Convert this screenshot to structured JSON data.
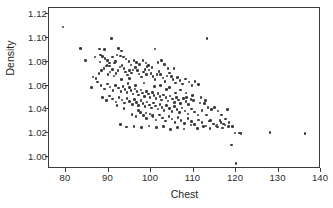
{
  "chart_data": {
    "type": "scatter",
    "title": "",
    "xlabel": "Chest",
    "ylabel": "Density",
    "xlim": [
      76,
      140
    ],
    "ylim": [
      0.99,
      1.125
    ],
    "xticks": [
      80,
      90,
      100,
      110,
      120,
      130,
      140
    ],
    "xtick_labels": [
      "80",
      "90",
      "100",
      "110",
      "120",
      "130",
      "140"
    ],
    "yticks": [
      1.0,
      1.02,
      1.04,
      1.06,
      1.08,
      1.1,
      1.12
    ],
    "ytick_labels": [
      "1.00",
      "1.02",
      "1.04",
      "1.06",
      "1.08",
      "1.10",
      "1.12"
    ],
    "grid": false,
    "legend": null,
    "marker_color": "#3b3b3b",
    "marker_size": 2.6,
    "n_points": 251,
    "correlation": "negative",
    "points": [
      [
        79.3,
        1.1089
      ],
      [
        83.4,
        1.0908
      ],
      [
        87.9,
        1.0905
      ],
      [
        89.0,
        1.0902
      ],
      [
        90.7,
        1.0993
      ],
      [
        92.4,
        1.0911
      ],
      [
        93.1,
        1.0889
      ],
      [
        84.6,
        1.0812
      ],
      [
        88.1,
        1.0855
      ],
      [
        88.6,
        1.0843
      ],
      [
        89.2,
        1.0828
      ],
      [
        89.8,
        1.0808
      ],
      [
        90.3,
        1.079
      ],
      [
        91.0,
        1.0838
      ],
      [
        91.6,
        1.0803
      ],
      [
        92.0,
        1.0857
      ],
      [
        92.8,
        1.0848
      ],
      [
        93.5,
        1.084
      ],
      [
        94.1,
        1.0822
      ],
      [
        94.8,
        1.0799
      ],
      [
        95.3,
        1.0771
      ],
      [
        96.0,
        1.0812
      ],
      [
        96.6,
        1.0793
      ],
      [
        97.3,
        1.0775
      ],
      [
        98.1,
        1.081
      ],
      [
        98.8,
        1.0788
      ],
      [
        99.4,
        1.0768
      ],
      [
        100.2,
        1.0752
      ],
      [
        100.9,
        1.0905
      ],
      [
        101.6,
        1.0795
      ],
      [
        102.5,
        1.081
      ],
      [
        103.2,
        1.0774
      ],
      [
        104.0,
        1.0744
      ],
      [
        105.4,
        1.0741
      ],
      [
        86.4,
        1.0671
      ],
      [
        87.1,
        1.0658
      ],
      [
        87.8,
        1.0699
      ],
      [
        88.4,
        1.0724
      ],
      [
        88.9,
        1.0745
      ],
      [
        89.4,
        1.0763
      ],
      [
        89.9,
        1.069
      ],
      [
        90.4,
        1.0712
      ],
      [
        90.9,
        1.0735
      ],
      [
        91.3,
        1.068
      ],
      [
        91.8,
        1.0702
      ],
      [
        92.2,
        1.0728
      ],
      [
        92.7,
        1.0755
      ],
      [
        93.2,
        1.077
      ],
      [
        93.6,
        1.0742
      ],
      [
        94.0,
        1.0715
      ],
      [
        94.5,
        1.0688
      ],
      [
        94.9,
        1.066
      ],
      [
        95.4,
        1.0706
      ],
      [
        95.8,
        1.0731
      ],
      [
        96.3,
        1.0752
      ],
      [
        96.8,
        1.0725
      ],
      [
        97.2,
        1.0698
      ],
      [
        97.7,
        1.067
      ],
      [
        98.2,
        1.0712
      ],
      [
        98.6,
        1.0736
      ],
      [
        99.1,
        1.076
      ],
      [
        99.5,
        1.073
      ],
      [
        100.0,
        1.0703
      ],
      [
        100.5,
        1.0676
      ],
      [
        100.9,
        1.0648
      ],
      [
        101.4,
        1.0694
      ],
      [
        101.9,
        1.0718
      ],
      [
        102.3,
        1.069
      ],
      [
        102.8,
        1.0662
      ],
      [
        103.3,
        1.0635
      ],
      [
        103.8,
        1.068
      ],
      [
        104.3,
        1.0704
      ],
      [
        104.8,
        1.0676
      ],
      [
        105.2,
        1.0648
      ],
      [
        105.7,
        1.062
      ],
      [
        106.2,
        1.0666
      ],
      [
        106.8,
        1.064
      ],
      [
        107.4,
        1.0612
      ],
      [
        108.1,
        1.0655
      ],
      [
        108.9,
        1.0628
      ],
      [
        109.6,
        1.06
      ],
      [
        110.4,
        1.0634
      ],
      [
        111.2,
        1.0608
      ],
      [
        86.0,
        1.0581
      ],
      [
        87.4,
        1.0628
      ],
      [
        88.2,
        1.06
      ],
      [
        89.0,
        1.0572
      ],
      [
        89.7,
        1.0612
      ],
      [
        90.4,
        1.0588
      ],
      [
        91.1,
        1.056
      ],
      [
        91.7,
        1.0602
      ],
      [
        92.3,
        1.0578
      ],
      [
        92.9,
        1.055
      ],
      [
        93.4,
        1.0592
      ],
      [
        93.9,
        1.0568
      ],
      [
        94.4,
        1.054
      ],
      [
        94.9,
        1.0582
      ],
      [
        95.3,
        1.0558
      ],
      [
        95.8,
        1.053
      ],
      [
        96.2,
        1.0572
      ],
      [
        96.7,
        1.0548
      ],
      [
        97.1,
        1.052
      ],
      [
        97.6,
        1.0562
      ],
      [
        98.0,
        1.0538
      ],
      [
        98.5,
        1.051
      ],
      [
        98.9,
        1.0552
      ],
      [
        99.4,
        1.0528
      ],
      [
        99.8,
        1.05
      ],
      [
        100.3,
        1.0542
      ],
      [
        100.7,
        1.0518
      ],
      [
        101.2,
        1.049
      ],
      [
        101.6,
        1.0532
      ],
      [
        102.1,
        1.0508
      ],
      [
        102.5,
        1.048
      ],
      [
        103.0,
        1.0522
      ],
      [
        103.5,
        1.0498
      ],
      [
        104.0,
        1.047
      ],
      [
        104.5,
        1.0512
      ],
      [
        105.0,
        1.0488
      ],
      [
        105.5,
        1.046
      ],
      [
        106.0,
        1.0502
      ],
      [
        106.5,
        1.0478
      ],
      [
        107.0,
        1.045
      ],
      [
        107.6,
        1.0492
      ],
      [
        108.2,
        1.0468
      ],
      [
        108.8,
        1.044
      ],
      [
        109.4,
        1.0482
      ],
      [
        88.6,
        1.0498
      ],
      [
        89.5,
        1.0472
      ],
      [
        90.3,
        1.0512
      ],
      [
        91.0,
        1.0488
      ],
      [
        91.8,
        1.0462
      ],
      [
        92.5,
        1.0502
      ],
      [
        93.2,
        1.0478
      ],
      [
        93.8,
        1.0452
      ],
      [
        94.4,
        1.0492
      ],
      [
        95.0,
        1.0468
      ],
      [
        95.6,
        1.0442
      ],
      [
        96.1,
        1.0482
      ],
      [
        96.6,
        1.0458
      ],
      [
        97.1,
        1.0432
      ],
      [
        97.6,
        1.0472
      ],
      [
        98.1,
        1.0448
      ],
      [
        98.6,
        1.0422
      ],
      [
        99.1,
        1.0462
      ],
      [
        99.6,
        1.0438
      ],
      [
        100.1,
        1.0412
      ],
      [
        100.6,
        1.0452
      ],
      [
        101.1,
        1.0428
      ],
      [
        101.6,
        1.0402
      ],
      [
        102.1,
        1.0442
      ],
      [
        102.6,
        1.0418
      ],
      [
        103.1,
        1.0392
      ],
      [
        103.7,
        1.0432
      ],
      [
        104.3,
        1.0408
      ],
      [
        104.9,
        1.0382
      ],
      [
        105.5,
        1.0422
      ],
      [
        106.1,
        1.0398
      ],
      [
        106.7,
        1.0372
      ],
      [
        107.3,
        1.0412
      ],
      [
        108.0,
        1.0388
      ],
      [
        108.7,
        1.0362
      ],
      [
        109.5,
        1.0402
      ],
      [
        110.3,
        1.0378
      ],
      [
        111.1,
        1.0352
      ],
      [
        112.0,
        1.0392
      ],
      [
        95.5,
        1.0358
      ],
      [
        96.5,
        1.0338
      ],
      [
        97.5,
        1.0372
      ],
      [
        98.3,
        1.0348
      ],
      [
        99.0,
        1.0322
      ],
      [
        99.8,
        1.0362
      ],
      [
        100.5,
        1.0338
      ],
      [
        101.2,
        1.0312
      ],
      [
        102.0,
        1.0352
      ],
      [
        102.7,
        1.0328
      ],
      [
        103.4,
        1.0302
      ],
      [
        104.2,
        1.0342
      ],
      [
        104.9,
        1.0318
      ],
      [
        105.6,
        1.0292
      ],
      [
        106.4,
        1.0332
      ],
      [
        107.1,
        1.0308
      ],
      [
        107.9,
        1.0282
      ],
      [
        108.7,
        1.0322
      ],
      [
        109.5,
        1.0298
      ],
      [
        110.3,
        1.0272
      ],
      [
        111.2,
        1.0312
      ],
      [
        112.0,
        1.0288
      ],
      [
        112.9,
        1.0262
      ],
      [
        113.8,
        1.0302
      ],
      [
        114.7,
        1.0278
      ],
      [
        115.6,
        1.0252
      ],
      [
        116.5,
        1.0292
      ],
      [
        117.4,
        1.0268
      ],
      [
        92.8,
        1.0272
      ],
      [
        94.2,
        1.0252
      ],
      [
        96.0,
        1.0258
      ],
      [
        97.8,
        1.0248
      ],
      [
        99.5,
        1.0262
      ],
      [
        101.3,
        1.0248
      ],
      [
        103.0,
        1.0258
      ],
      [
        104.6,
        1.0232
      ],
      [
        106.2,
        1.025
      ],
      [
        107.8,
        1.0235
      ],
      [
        109.4,
        1.0268
      ],
      [
        110.9,
        1.0242
      ],
      [
        112.4,
        1.0258
      ],
      [
        113.9,
        1.0238
      ],
      [
        115.3,
        1.0262
      ],
      [
        116.8,
        1.0245
      ],
      [
        118.3,
        1.0258
      ],
      [
        119.8,
        1.0202
      ],
      [
        121.2,
        1.02
      ],
      [
        113.2,
        1.0992
      ],
      [
        111.8,
        1.0498
      ],
      [
        112.6,
        1.0448
      ],
      [
        113.4,
        1.0418
      ],
      [
        114.2,
        1.0398
      ],
      [
        115.0,
        1.0418
      ],
      [
        115.8,
        1.0388
      ],
      [
        116.6,
        1.0352
      ],
      [
        117.5,
        1.0318
      ],
      [
        118.4,
        1.0288
      ],
      [
        119.2,
        1.0258
      ],
      [
        113.0,
        1.0352
      ],
      [
        114.0,
        1.0308
      ],
      [
        114.8,
        1.0278
      ],
      [
        115.5,
        1.0268
      ],
      [
        116.2,
        1.0305
      ],
      [
        117.0,
        1.0278
      ],
      [
        118.0,
        1.0398
      ],
      [
        119.0,
        1.0102
      ],
      [
        120.0,
        0.9948
      ],
      [
        120.8,
        1.0202
      ],
      [
        128.0,
        1.0208
      ],
      [
        136.2,
        1.0198
      ],
      [
        90.2,
        1.0762
      ],
      [
        91.4,
        1.0788
      ],
      [
        95.0,
        1.0725
      ],
      [
        99.0,
        1.069
      ],
      [
        100.8,
        1.0592
      ],
      [
        103.6,
        1.0568
      ],
      [
        105.8,
        1.0538
      ],
      [
        108.4,
        1.0498
      ],
      [
        110.0,
        1.0472
      ],
      [
        111.5,
        1.0452
      ],
      [
        86.8,
        1.0838
      ],
      [
        88.0,
        1.0798
      ],
      [
        89.6,
        1.0768
      ],
      [
        93.0,
        1.0648
      ],
      [
        94.6,
        1.0618
      ],
      [
        96.4,
        1.0598
      ],
      [
        98.4,
        1.0622
      ],
      [
        102.2,
        1.0602
      ],
      [
        104.4,
        1.0582
      ],
      [
        106.9,
        1.0562
      ],
      [
        108.2,
        1.0538
      ],
      [
        109.8,
        1.0518
      ],
      [
        112.8,
        1.0472
      ],
      [
        97.0,
        1.0392
      ],
      [
        98.8,
        1.0368
      ],
      [
        100.4,
        1.0348
      ],
      [
        92.0,
        1.0432
      ],
      [
        93.6,
        1.0408
      ]
    ]
  }
}
